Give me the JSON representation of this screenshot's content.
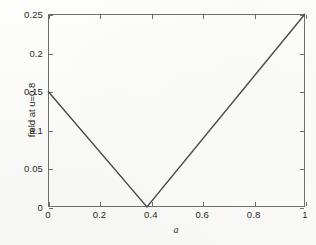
{
  "figure": {
    "background_color": "#fbfbfa",
    "axes_color": "#6e6e6e",
    "line_color": "#4a4a4a",
    "text_color": "#2b2b2b"
  },
  "chart_data": {
    "type": "line",
    "title": "",
    "xlabel": "a",
    "ylabel": "field at u=0.8",
    "xlim": [
      0,
      1
    ],
    "ylim": [
      0,
      0.25
    ],
    "grid": false,
    "legend": null,
    "xticks": [
      0,
      0.2,
      0.4,
      0.6,
      0.8,
      1
    ],
    "xticklabels": [
      "0",
      "0.2",
      "0.4",
      "0.6",
      "0.8",
      "1"
    ],
    "yticks": [
      0,
      0.05,
      0.1,
      0.15,
      0.2,
      0.25
    ],
    "yticklabels": [
      "0",
      "0.05",
      "0.1",
      "0.15",
      "0.2",
      "0.25"
    ],
    "series": [
      {
        "name": "field at u=0.8",
        "x": [
          0,
          0.385,
          1
        ],
        "y": [
          0.15,
          0,
          0.25
        ]
      }
    ],
    "annotations": []
  }
}
